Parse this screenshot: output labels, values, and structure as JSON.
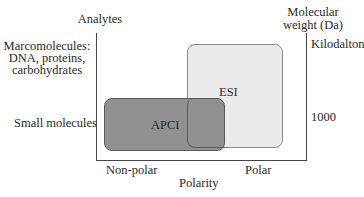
{
  "diagram": {
    "y_axis_left_title": "Analytes",
    "y_axis_right_title_line1": "Molecular",
    "y_axis_right_title_line2": "weight (Da)",
    "left_labels": {
      "top_line1": "Marcomolecules:",
      "top_line2": "DNA, proteins,",
      "top_line3": "carbohydrates",
      "bottom": "Small molecules"
    },
    "right_labels": {
      "top": "Kilodalton",
      "bottom": "1000"
    },
    "x_axis": {
      "title": "Polarity",
      "left": "Non-polar",
      "right": "Polar"
    },
    "regions": [
      {
        "name": "ESI",
        "fill": "#ebebeb",
        "x_range": [
          "mid-polar",
          "polar"
        ],
        "y_range": [
          "small",
          "large"
        ]
      },
      {
        "name": "APCI",
        "fill": "#8d8d8d",
        "x_range": [
          "non-polar",
          "mid-polar"
        ],
        "y_range": [
          "small",
          "small"
        ]
      }
    ]
  }
}
